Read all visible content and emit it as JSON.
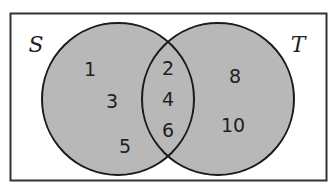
{
  "diagram": {
    "type": "venn",
    "colors": {
      "background": "#ffffff",
      "fill": "#b8b8b8",
      "stroke": "#1a1a1a"
    },
    "universe": {
      "label": ""
    },
    "sets": [
      {
        "label": "S",
        "only_elements": [
          "1",
          "3",
          "5"
        ]
      },
      {
        "label": "T",
        "only_elements": [
          "8",
          "10"
        ]
      }
    ],
    "intersection": {
      "elements": [
        "2",
        "4",
        "6"
      ]
    }
  }
}
